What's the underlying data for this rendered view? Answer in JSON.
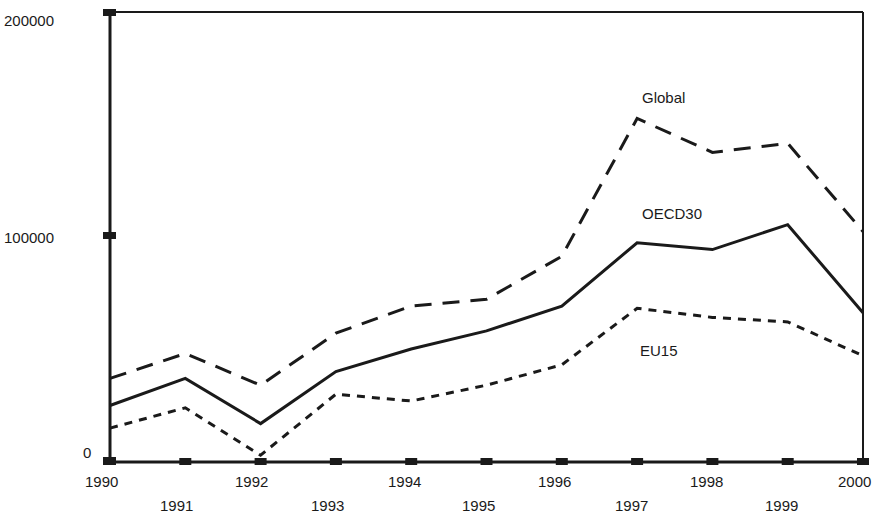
{
  "chart_data": {
    "type": "line",
    "title": "",
    "subtitle": "",
    "xlabel": "",
    "ylabel": "",
    "x": [
      1990,
      1991,
      1992,
      1993,
      1994,
      1995,
      1996,
      1997,
      1998,
      1999,
      2000
    ],
    "categories": [
      "1990",
      "1991",
      "1992",
      "1993",
      "1994",
      "1995",
      "1996",
      "1997",
      "1998",
      "1999",
      "2000"
    ],
    "xtick_labels_upper": [
      "1990",
      "",
      "1992",
      "",
      "1994",
      "",
      "1996",
      "",
      "1998",
      "",
      "2000"
    ],
    "xtick_labels_lower": [
      "",
      "1991",
      "",
      "1993",
      "",
      "1995",
      "",
      "1997",
      "",
      "1999",
      ""
    ],
    "ytick_labels": [
      "0",
      "100000",
      "200000"
    ],
    "ytick_values": [
      0,
      100000,
      200000
    ],
    "ylim": [
      0,
      200000
    ],
    "xlim": [
      1990,
      2000
    ],
    "grid": false,
    "legend_position": "inline-annotation",
    "series": [
      {
        "name": "Global",
        "style": "long-dashed",
        "color": "#1a1a1a",
        "label_x": 1997,
        "values": [
          37000,
          48000,
          34000,
          57000,
          69000,
          72000,
          91000,
          152000,
          137000,
          141000,
          102000
        ]
      },
      {
        "name": "OECD30",
        "style": "solid",
        "color": "#1a1a1a",
        "label_x": 1997,
        "values": [
          25000,
          37000,
          17000,
          40000,
          50000,
          58000,
          69000,
          97000,
          94000,
          105000,
          66000
        ]
      },
      {
        "name": "EU15",
        "style": "short-dashed",
        "color": "#1a1a1a",
        "label_x": 1997,
        "values": [
          15000,
          24000,
          3000,
          30000,
          27000,
          34000,
          43000,
          68000,
          64000,
          62000,
          47000
        ]
      }
    ],
    "annotations": [
      {
        "text": "Global",
        "x_px": 642,
        "y_px": 103
      },
      {
        "text": "OECD30",
        "x_px": 642,
        "y_px": 219
      },
      {
        "text": "EU15",
        "x_px": 640,
        "y_px": 356
      }
    ]
  },
  "axis": {
    "y_labels": [
      {
        "text": "200000",
        "x_px": 4,
        "y_px": 26
      },
      {
        "text": "100000",
        "x_px": 4,
        "y_px": 243
      },
      {
        "text": "0",
        "x_px": 83,
        "y_px": 458
      }
    ],
    "x_labels_upper": [
      {
        "text": "1990",
        "x_px": 85,
        "y_px": 487
      },
      {
        "text": "1992",
        "x_px": 235,
        "y_px": 487
      },
      {
        "text": "1994",
        "x_px": 388,
        "y_px": 487
      },
      {
        "text": "1996",
        "x_px": 538,
        "y_px": 487
      },
      {
        "text": "1998",
        "x_px": 690,
        "y_px": 487
      },
      {
        "text": "2000",
        "x_px": 838,
        "y_px": 487
      }
    ],
    "x_labels_lower": [
      {
        "text": "1991",
        "x_px": 160,
        "y_px": 511
      },
      {
        "text": "1993",
        "x_px": 311,
        "y_px": 511
      },
      {
        "text": "1995",
        "x_px": 462,
        "y_px": 511
      },
      {
        "text": "1997",
        "x_px": 615,
        "y_px": 511
      },
      {
        "text": "1999",
        "x_px": 765,
        "y_px": 511
      }
    ]
  },
  "plot_geometry": {
    "left_px": 110,
    "right_px": 863,
    "top_px": 12,
    "bottom_px": 462,
    "y_zero_px": 462,
    "y_100k_px": 236,
    "y_200k_px": 12
  }
}
